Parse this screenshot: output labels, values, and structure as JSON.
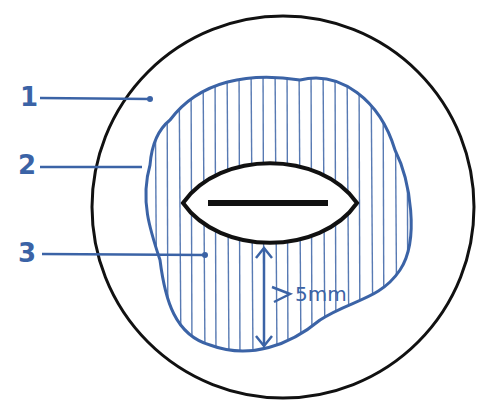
{
  "diagram": {
    "labels": [
      {
        "id": "1",
        "text": "1"
      },
      {
        "id": "2",
        "text": "2"
      },
      {
        "id": "3",
        "text": "3"
      }
    ],
    "dimension": {
      "text": "5mm"
    },
    "colors": {
      "blue": "#3b63a6",
      "black": "#111111"
    }
  }
}
